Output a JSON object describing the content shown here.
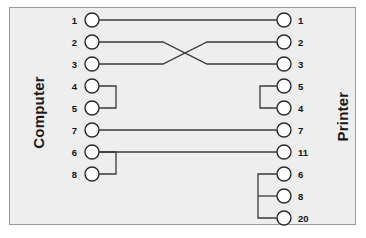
{
  "figure": {
    "kind": "cable-wiring-diagram",
    "background_color": "#eeeeee",
    "page_color": "#ffffff",
    "border_color": "#9a9a9a",
    "line_color": "#3a3a3a",
    "connector_fill": "#ffffff",
    "connector_stroke": "#2b2b2b"
  },
  "sides": {
    "left": {
      "label": "Computer",
      "pins": [
        {
          "number": "1",
          "row": 0
        },
        {
          "number": "2",
          "row": 1
        },
        {
          "number": "3",
          "row": 2
        },
        {
          "number": "4",
          "row": 3
        },
        {
          "number": "5",
          "row": 4
        },
        {
          "number": "7",
          "row": 5
        },
        {
          "number": "6",
          "row": 6
        },
        {
          "number": "8",
          "row": 7
        }
      ]
    },
    "right": {
      "label": "Printer",
      "pins": [
        {
          "number": "1",
          "row": 0
        },
        {
          "number": "2",
          "row": 1
        },
        {
          "number": "3",
          "row": 2
        },
        {
          "number": "5",
          "row": 3
        },
        {
          "number": "4",
          "row": 4
        },
        {
          "number": "7",
          "row": 5
        },
        {
          "number": "11",
          "row": 6
        },
        {
          "number": "6",
          "row": 7
        },
        {
          "number": "8",
          "row": 8
        },
        {
          "number": "20",
          "row": 9
        }
      ]
    }
  },
  "connections": [
    {
      "type": "straight",
      "from": "computer-1",
      "to": "printer-1"
    },
    {
      "type": "crossover",
      "from": "computer-2",
      "to": "printer-3"
    },
    {
      "type": "crossover",
      "from": "computer-3",
      "to": "printer-2"
    },
    {
      "type": "jumper",
      "side": "computer",
      "pins": [
        "4",
        "5"
      ]
    },
    {
      "type": "jumper",
      "side": "printer",
      "pins": [
        "5",
        "4"
      ]
    },
    {
      "type": "straight",
      "from": "computer-7",
      "to": "printer-7"
    },
    {
      "type": "straight",
      "from": "computer-6",
      "to": "printer-11"
    },
    {
      "type": "jumper",
      "side": "computer",
      "pins": [
        "6",
        "8"
      ]
    },
    {
      "type": "jumper",
      "side": "printer",
      "pins": [
        "6",
        "8",
        "20"
      ]
    }
  ]
}
